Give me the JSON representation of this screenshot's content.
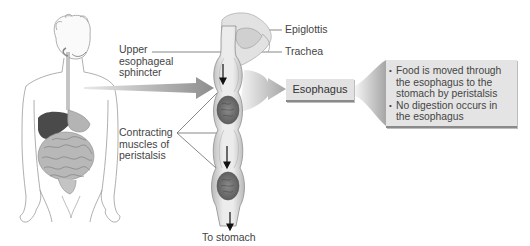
{
  "diagram": {
    "labels": {
      "upper_sphincter": [
        "Upper",
        "esophageal",
        "sphincter"
      ],
      "contracting_muscles": [
        "Contracting",
        "muscles of",
        "peristalsis"
      ],
      "epiglottis": "Epiglottis",
      "trachea": "Trachea",
      "to_stomach": "To stomach"
    },
    "organ_box": {
      "label": "Esophagus"
    },
    "info_box": {
      "bullets": [
        "Food is moved through the esophagus to the stomach by peristalsis",
        "No digestion occurs in the esophagus"
      ]
    },
    "colors": {
      "box_fill": "#e2e2e2",
      "box_border": "#8a8a8a",
      "arrow": "#9a9a9a",
      "liver": "#4a4a4a",
      "line": "#555555"
    }
  }
}
